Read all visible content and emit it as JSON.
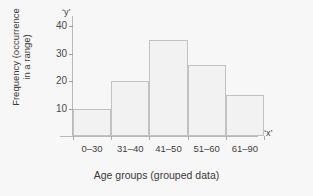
{
  "chart_data": {
    "type": "bar",
    "title": "",
    "categories": [
      "0–30",
      "31–40",
      "41–50",
      "51–60",
      "61–90"
    ],
    "values": [
      10,
      20,
      35,
      26,
      15
    ],
    "xlabel": "Age groups (grouped data)",
    "ylabel_line1": "Frequency (occurrence",
    "ylabel_line2": "in a range)",
    "y_ticks": [
      10,
      20,
      30,
      40
    ],
    "ylim": [
      0,
      43
    ],
    "x_axis_marker": "‘x’",
    "y_axis_marker": "‘y’",
    "grid": false,
    "legend": "none",
    "bar_fill": "#f2f2f2",
    "bar_border": "#c2c2c2",
    "axis_color": "#b9b9b9",
    "background": "#f7f7f7"
  }
}
